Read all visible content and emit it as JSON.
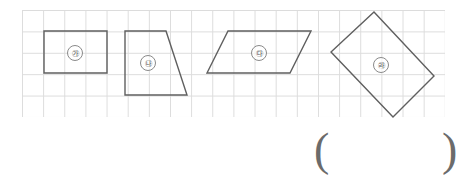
{
  "worksheet": {
    "title": "Quadrilaterals on grid paper",
    "grid": {
      "name": "grid-paper",
      "cell_size_px": 21,
      "columns": 20,
      "rows": 5,
      "line_color": "#dcdcdc"
    },
    "shape_stroke_color": "#5f5f5f",
    "shapes": [
      {
        "id": "shape-a",
        "label": "㉮",
        "kind": "rectangle",
        "points": "44,31 107,31 107,73 44,73",
        "label_x": 67,
        "label_y": 45
      },
      {
        "id": "shape-b",
        "label": "㉯",
        "kind": "trapezoid",
        "points": "125,31 166,31 187,95 125,95",
        "label_x": 140,
        "label_y": 55
      },
      {
        "id": "shape-c",
        "label": "㉰",
        "kind": "parallelogram",
        "points": "228,31 311,31 290,73 207,73",
        "label_x": 251,
        "label_y": 45
      },
      {
        "id": "shape-d",
        "label": "㉱",
        "kind": "rotated-square",
        "points": "374,12 434,76 393,117 331,52",
        "label_x": 373,
        "label_y": 57
      }
    ],
    "answer": {
      "open_paren": "(",
      "close_paren": ")",
      "value": ""
    }
  }
}
